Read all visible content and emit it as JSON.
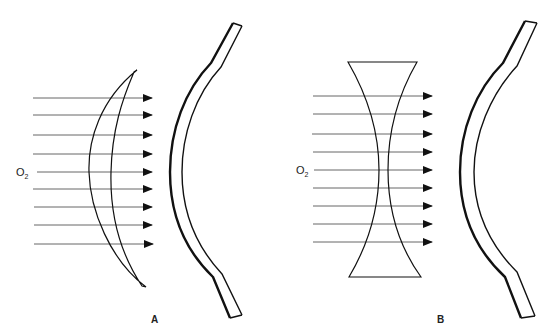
{
  "figure": {
    "panels": [
      {
        "id": "A",
        "label": "A",
        "gas_label": "O",
        "gas_subscript": "2",
        "lens_type": "convex-meniscus",
        "arrow_count": 9
      },
      {
        "id": "B",
        "label": "B",
        "gas_label": "O",
        "gas_subscript": "2",
        "lens_type": "biconcave",
        "arrow_count": 9
      }
    ],
    "colors": {
      "line": "#111111",
      "arrow": "#555555",
      "background": "#ffffff"
    }
  }
}
